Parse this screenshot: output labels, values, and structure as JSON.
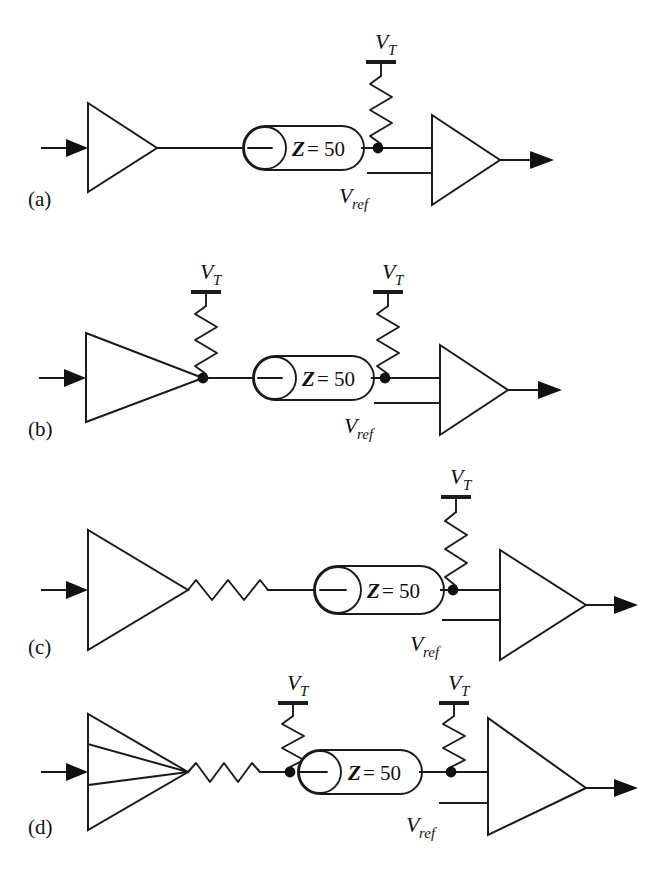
{
  "figure": {
    "type": "circuit-diagram",
    "background_color": "#ffffff",
    "line_color": "#1a1a1a",
    "panel_count": 4
  },
  "labels": {
    "v_terminator": "V",
    "v_terminator_sub": "T",
    "v_reference": "V",
    "v_reference_sub": "ref",
    "impedance_symbol": "Z",
    "impedance_value": "= 50"
  },
  "panels": [
    {
      "id": "a",
      "label": "(a)",
      "description": "Parallel termination at receiver only",
      "driver": "buffer-amplifier",
      "cable": {
        "symbol": "coaxial-cable",
        "impedance_symbol": "Z",
        "impedance_value": "= 50"
      },
      "series_resistor": false,
      "source_termination": false,
      "load_termination": true,
      "terminations": [
        {
          "position": "load",
          "supply_label": "V",
          "supply_sub": "T"
        }
      ],
      "receiver": {
        "type": "comparator",
        "ref_label": "V",
        "ref_sub": "ref"
      }
    },
    {
      "id": "b",
      "label": "(b)",
      "description": "Parallel termination at both source and receiver",
      "driver": "buffer-amplifier",
      "cable": {
        "symbol": "coaxial-cable",
        "impedance_symbol": "Z",
        "impedance_value": "= 50"
      },
      "series_resistor": false,
      "source_termination": true,
      "load_termination": true,
      "terminations": [
        {
          "position": "source",
          "supply_label": "V",
          "supply_sub": "T"
        },
        {
          "position": "load",
          "supply_label": "V",
          "supply_sub": "T"
        }
      ],
      "receiver": {
        "type": "comparator",
        "ref_label": "V",
        "ref_sub": "ref"
      }
    },
    {
      "id": "c",
      "label": "(c)",
      "description": "Series source resistor with parallel termination at receiver",
      "driver": "buffer-amplifier",
      "cable": {
        "symbol": "coaxial-cable",
        "impedance_symbol": "Z",
        "impedance_value": "= 50"
      },
      "series_resistor": true,
      "source_termination": false,
      "load_termination": true,
      "terminations": [
        {
          "position": "load",
          "supply_label": "V",
          "supply_sub": "T"
        }
      ],
      "receiver": {
        "type": "comparator",
        "ref_label": "V",
        "ref_sub": "ref"
      }
    },
    {
      "id": "d",
      "label": "(d)",
      "description": "Series source resistor with parallel termination at source and receiver",
      "driver": "buffer-amplifier",
      "cable": {
        "symbol": "coaxial-cable",
        "impedance_symbol": "Z",
        "impedance_value": "= 50"
      },
      "series_resistor": true,
      "source_termination": true,
      "load_termination": true,
      "terminations": [
        {
          "position": "source",
          "supply_label": "V",
          "supply_sub": "T"
        },
        {
          "position": "load",
          "supply_label": "V",
          "supply_sub": "T"
        }
      ],
      "receiver": {
        "type": "comparator",
        "ref_label": "V",
        "ref_sub": "ref"
      }
    }
  ]
}
